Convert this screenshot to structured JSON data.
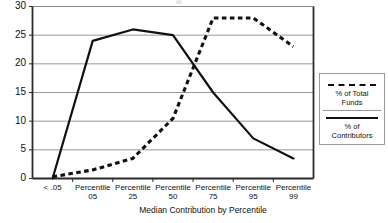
{
  "chart_data": {
    "type": "line",
    "title": "",
    "xlabel": "Median Contribution by Percentile",
    "ylabel": "",
    "categories": [
      "< .05",
      "Percentile 05",
      "Percentile 25",
      "Percentile 50",
      "Percentile 75",
      "Percentile 95",
      "Percentile 99"
    ],
    "category_lines": [
      {
        "line1": "< .05",
        "line2": ""
      },
      {
        "line1": "Percentile",
        "line2": "05"
      },
      {
        "line1": "Percentile",
        "line2": "25"
      },
      {
        "line1": "Percentile",
        "line2": "50"
      },
      {
        "line1": "Percentile",
        "line2": "75"
      },
      {
        "line1": "Percentile",
        "line2": "95"
      },
      {
        "line1": "Percentile",
        "line2": "99"
      }
    ],
    "ylim": [
      0,
      30
    ],
    "yticks": [
      0,
      5,
      10,
      15,
      20,
      25,
      30
    ],
    "ytick_labels": [
      "0",
      "5",
      "10",
      "15",
      "20",
      "25",
      "30"
    ],
    "grid": true,
    "grid_axis": "y",
    "legend_position": "right-outside",
    "series": [
      {
        "name": "% of Total Funds",
        "style": "dashed",
        "color": "#111111",
        "values": [
          0.3,
          1.5,
          3.5,
          10.5,
          28,
          28,
          23
        ]
      },
      {
        "name": "% of Contributors",
        "style": "solid",
        "color": "#111111",
        "values": [
          0,
          24,
          26,
          25,
          15,
          7,
          3.5
        ]
      }
    ]
  },
  "legend": {
    "items": [
      {
        "label_line1": "% of Total",
        "label_line2": "Funds",
        "style": "dashed"
      },
      {
        "label_line1": "% of",
        "label_line2": "Contributors",
        "style": "solid"
      }
    ]
  },
  "axis": {
    "x_title": "Median Contribution by Percentile"
  }
}
